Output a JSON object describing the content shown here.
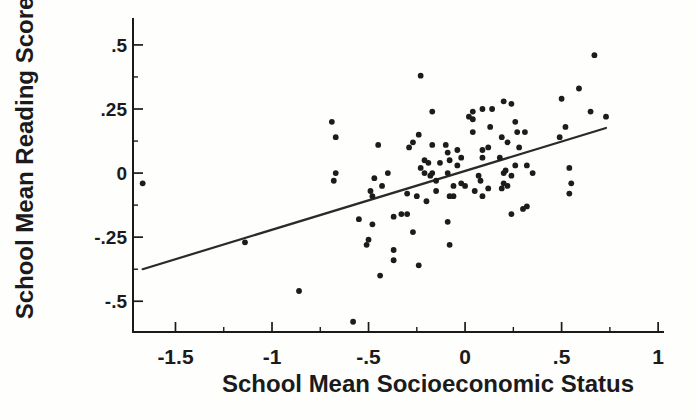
{
  "chart_data": {
    "type": "scatter",
    "title": "",
    "xlabel": "School Mean Socioeconomic Status",
    "ylabel": "School Mean Reading Score",
    "xlim": [
      -1.72,
      1.02
    ],
    "ylim": [
      -0.62,
      0.605
    ],
    "grid": false,
    "legend": null,
    "x_major_ticks": [
      -1.5,
      -1,
      -0.5,
      0,
      0.5,
      1
    ],
    "x_major_labels": [
      "-1.5",
      "-1",
      "-.5",
      "0",
      ".5",
      "1"
    ],
    "x_minor_ticks": [
      -1.25,
      -0.75,
      -0.25,
      0.25,
      0.75
    ],
    "y_major_ticks": [
      0.5,
      0.25,
      0,
      -0.25,
      -0.5
    ],
    "y_major_labels": [
      ".5",
      ".25",
      "0",
      "-.25",
      "-.5"
    ],
    "y_minor_ticks": [
      0.375,
      0.125,
      -0.125,
      -0.375
    ],
    "point_color": "#1c1c1c",
    "line_color": "#2a2a2a",
    "axis_color": "#1a1a1a",
    "regression_line": {
      "x1": -1.67,
      "y1": -0.375,
      "x2": 0.73,
      "y2": 0.176
    },
    "points": [
      [
        -1.67,
        -0.04
      ],
      [
        -1.14,
        -0.27
      ],
      [
        -0.86,
        -0.46
      ],
      [
        -0.69,
        0.2
      ],
      [
        -0.67,
        0.14
      ],
      [
        -0.67,
        0.0
      ],
      [
        -0.68,
        -0.03
      ],
      [
        -0.58,
        -0.58
      ],
      [
        -0.55,
        -0.18
      ],
      [
        -0.51,
        -0.28
      ],
      [
        -0.5,
        -0.26
      ],
      [
        -0.49,
        -0.07
      ],
      [
        -0.48,
        -0.09
      ],
      [
        -0.48,
        -0.2
      ],
      [
        -0.47,
        -0.02
      ],
      [
        -0.45,
        0.11
      ],
      [
        -0.44,
        -0.4
      ],
      [
        -0.43,
        -0.05
      ],
      [
        -0.4,
        0.0
      ],
      [
        -0.37,
        -0.34
      ],
      [
        -0.37,
        -0.17
      ],
      [
        -0.37,
        -0.3
      ],
      [
        -0.33,
        -0.16
      ],
      [
        -0.3,
        -0.08
      ],
      [
        -0.3,
        -0.16
      ],
      [
        -0.29,
        0.1
      ],
      [
        -0.27,
        0.12
      ],
      [
        -0.27,
        -0.23
      ],
      [
        -0.25,
        -0.09
      ],
      [
        -0.24,
        0.15
      ],
      [
        -0.24,
        -0.36
      ],
      [
        -0.23,
        0.38
      ],
      [
        -0.23,
        0.02
      ],
      [
        -0.21,
        0.05
      ],
      [
        -0.19,
        0.04
      ],
      [
        -0.21,
        0.0
      ],
      [
        -0.18,
        -0.01
      ],
      [
        -0.17,
        0.0
      ],
      [
        -0.17,
        0.11
      ],
      [
        -0.17,
        0.24
      ],
      [
        -0.2,
        -0.11
      ],
      [
        -0.15,
        -0.03
      ],
      [
        -0.15,
        -0.07
      ],
      [
        -0.13,
        0.04
      ],
      [
        -0.1,
        0.11
      ],
      [
        -0.09,
        0.08
      ],
      [
        -0.09,
        0.0
      ],
      [
        -0.08,
        -0.28
      ],
      [
        -0.09,
        -0.19
      ],
      [
        -0.08,
        -0.09
      ],
      [
        -0.06,
        -0.09
      ],
      [
        -0.08,
        0.05
      ],
      [
        -0.04,
        0.03
      ],
      [
        -0.04,
        0.09
      ],
      [
        -0.02,
        0.06
      ],
      [
        -0.06,
        -0.05
      ],
      [
        -0.02,
        -0.04
      ],
      [
        0.0,
        -0.05
      ],
      [
        0.02,
        0.22
      ],
      [
        0.04,
        0.21
      ],
      [
        0.04,
        0.24
      ],
      [
        0.04,
        0.16
      ],
      [
        0.05,
        -0.07
      ],
      [
        0.07,
        -0.01
      ],
      [
        0.08,
        -0.03
      ],
      [
        0.09,
        -0.09
      ],
      [
        0.09,
        0.25
      ],
      [
        0.09,
        0.09
      ],
      [
        0.12,
        0.1
      ],
      [
        0.09,
        0.06
      ],
      [
        0.12,
        -0.06
      ],
      [
        0.14,
        0.25
      ],
      [
        0.13,
        0.18
      ],
      [
        0.18,
        0.06
      ],
      [
        0.19,
        -0.06
      ],
      [
        0.2,
        0.28
      ],
      [
        0.2,
        0.0
      ],
      [
        0.2,
        -0.04
      ],
      [
        0.22,
        -0.05
      ],
      [
        0.22,
        0.12
      ],
      [
        0.19,
        0.14
      ],
      [
        0.21,
        0.01
      ],
      [
        0.24,
        0.27
      ],
      [
        0.24,
        -0.01
      ],
      [
        0.24,
        -0.16
      ],
      [
        0.26,
        0.03
      ],
      [
        0.26,
        0.2
      ],
      [
        0.27,
        0.16
      ],
      [
        0.28,
        0.1
      ],
      [
        0.3,
        -0.14
      ],
      [
        0.32,
        -0.13
      ],
      [
        0.31,
        0.16
      ],
      [
        0.32,
        0.03
      ],
      [
        0.35,
        0.0
      ],
      [
        0.5,
        0.29
      ],
      [
        0.49,
        0.14
      ],
      [
        0.52,
        0.18
      ],
      [
        0.54,
        0.02
      ],
      [
        0.55,
        -0.04
      ],
      [
        0.54,
        -0.08
      ],
      [
        0.59,
        0.33
      ],
      [
        0.65,
        0.24
      ],
      [
        0.67,
        0.46
      ],
      [
        0.73,
        0.22
      ]
    ]
  }
}
